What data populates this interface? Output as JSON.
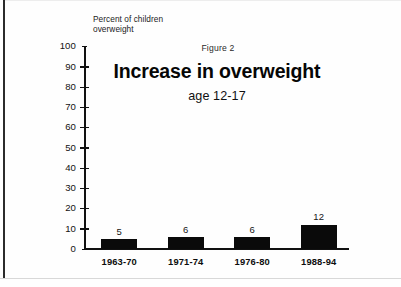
{
  "figure": {
    "caption": "Figure 2",
    "title": "Increase in overweight",
    "subtitle": "age 12-17",
    "y_axis_label": "Percent of children\noverweight"
  },
  "chart_data": {
    "type": "bar",
    "title": "Increase in overweight",
    "subtitle": "age 12-17",
    "caption": "Figure 2",
    "categories": [
      "1963-70",
      "1971-74",
      "1976-80",
      "1988-94"
    ],
    "values": [
      5,
      6,
      6,
      12
    ],
    "xlabel": "",
    "ylabel": "Percent of children overweight",
    "ylim": [
      0,
      100
    ],
    "ytick_labels": [
      "100",
      "90",
      "80",
      "70",
      "60",
      "50",
      "40",
      "30",
      "20",
      "10",
      "0"
    ],
    "ytick_values": [
      100,
      90,
      80,
      70,
      60,
      50,
      40,
      30,
      20,
      10,
      0
    ],
    "grid": false,
    "legend": false,
    "bar_color": "#0a0a0a",
    "axis_color": "#111111",
    "background": "#ffffff",
    "data_labels": [
      "5",
      "6",
      "6",
      "12"
    ]
  }
}
